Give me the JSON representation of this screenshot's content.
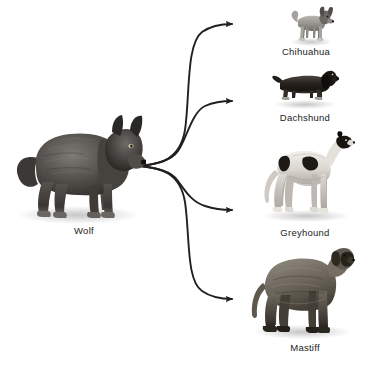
{
  "figure": {
    "background_color": "#ffffff",
    "label_color": "#1b1b1b",
    "arrow_color": "#231f20"
  },
  "ancestor": {
    "label": "Wolf",
    "label_x": 84,
    "label_y": 225,
    "art_x": 12,
    "art_y": 110,
    "art_w": 134,
    "art_h": 112
  },
  "descendants": [
    {
      "id": "chihuahua",
      "label": "Chihuahua",
      "label_x": 306,
      "label_y": 46,
      "art_x": 288,
      "art_y": 6,
      "art_w": 46,
      "art_h": 38
    },
    {
      "id": "dachshund",
      "label": "Dachshund",
      "label_x": 305,
      "label_y": 112,
      "art_x": 271,
      "art_y": 64,
      "art_w": 68,
      "art_h": 44
    },
    {
      "id": "greyhound",
      "label": "Greyhound",
      "label_x": 305,
      "label_y": 227,
      "art_x": 259,
      "art_y": 126,
      "art_w": 96,
      "art_h": 96
    },
    {
      "id": "mastiff",
      "label": "Mastiff",
      "label_x": 305,
      "label_y": 342,
      "art_x": 249,
      "art_y": 243,
      "art_w": 106,
      "art_h": 94
    }
  ],
  "arrows": [
    {
      "id": "arrow-to-chihuahua",
      "path": "M 140 166 C 160 164 180 160 185 130 C 190 96 186 44 202 32 C 212 25 222 24 231 24",
      "tip_x": 240,
      "tip_y": 24
    },
    {
      "id": "arrow-to-dachshund",
      "path": "M 140 166 C 158 164 172 160 179 150 C 186 140 192 112 205 106 C 214 102 222 101 231 101",
      "tip_x": 240,
      "tip_y": 101
    },
    {
      "id": "arrow-to-greyhound",
      "path": "M 140 166 C 158 168 172 172 179 182 C 186 192 192 202 205 206 C 214 209 222 210 231 210",
      "tip_x": 240,
      "tip_y": 210
    },
    {
      "id": "arrow-to-mastiff",
      "path": "M 140 166 C 160 168 180 172 185 202 C 190 236 186 280 202 291 C 212 298 222 299 231 299",
      "tip_x": 240,
      "tip_y": 299
    }
  ]
}
